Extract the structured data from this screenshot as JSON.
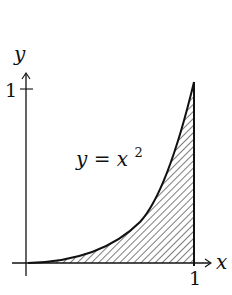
{
  "diagram": {
    "axes": {
      "x_label": "x",
      "y_label": "y",
      "x_tick_label": "1",
      "y_tick_label": "1"
    },
    "curve": {
      "label_lhs": "y = x",
      "label_exp": "2",
      "equation": "y = x^2"
    },
    "region": {
      "fill": "hatched",
      "bounds": "0 ≤ x ≤ 1, 0 ≤ y ≤ x^2"
    },
    "colors": {
      "stroke": "#111111",
      "background": "#ffffff"
    }
  }
}
